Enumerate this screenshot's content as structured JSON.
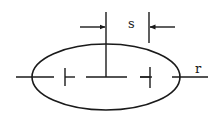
{
  "diagram": {
    "type": "engineering-dimension-sketch",
    "colors": {
      "stroke": "#1a1a1a",
      "background": "#ffffff"
    },
    "labels": {
      "spacing": "s",
      "radius": "r"
    },
    "shapes": {
      "ellipse": {
        "cx": 106,
        "cy": 77,
        "rx": 74,
        "ry": 33
      },
      "centerline_segments": [
        {
          "x1": 16,
          "x2": 54
        },
        {
          "x1": 86,
          "x2": 127
        },
        {
          "x1": 140,
          "x2": 152
        },
        {
          "x1": 172,
          "x2": 208
        }
      ],
      "left_tick": {
        "x": 65,
        "y1": 68,
        "y2": 86,
        "stub_to": 75
      },
      "right_tick": {
        "x": 150,
        "y1": 67,
        "y2": 88,
        "stub_from": 140
      },
      "center_vertical": {
        "x": 106,
        "y1": 12,
        "y2": 77
      },
      "offset_vertical": {
        "x": 149,
        "y1": 12,
        "y2": 43
      },
      "arrow_left": {
        "from_x": 80,
        "to_x": 105,
        "y": 27
      },
      "arrow_right": {
        "from_x": 175,
        "to_x": 150,
        "y": 27
      }
    }
  }
}
